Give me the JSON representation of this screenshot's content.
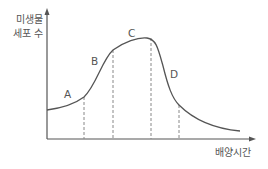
{
  "diagram": {
    "y_axis_label_line1": "미생물",
    "y_axis_label_line2": "세포 수",
    "x_axis_label": "배양시간",
    "phases": [
      {
        "label": "A"
      },
      {
        "label": "B"
      },
      {
        "label": "C"
      },
      {
        "label": "D"
      }
    ],
    "colors": {
      "axis": "#555555",
      "curve": "#555555",
      "dashed": "#888888",
      "text": "#555555"
    }
  }
}
